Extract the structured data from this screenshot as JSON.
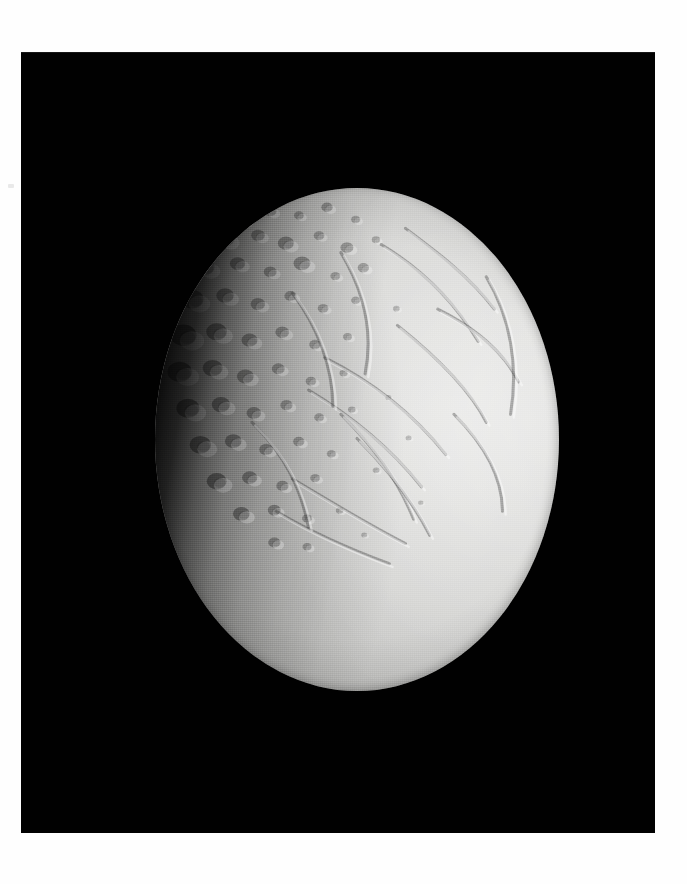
{
  "page": {
    "background_color": "#fefefe",
    "frame_color": "#010101",
    "width": 687,
    "height": 884
  },
  "photo": {
    "subject": "Enceladus",
    "caption": "",
    "frame": {
      "x": 21,
      "y": 52,
      "width": 634,
      "height": 781
    },
    "body": {
      "name": "Enceladus",
      "disk": {
        "center_x": 357,
        "center_y": 440,
        "radius_x": 202,
        "radius_y": 251
      },
      "illumination": "crescent-gibbous, terminator on the left limb",
      "light_direction": "from upper right",
      "surface_color_bright": "#e2e2e0",
      "surface_color_mid": "#c2c2c0",
      "surface_color_shadow": "#2e2e2d",
      "space_color": "#010101"
    },
    "terrain_regions": [
      {
        "name": "cratered-terrain",
        "label": "heavily cratered terrain",
        "position": "west / terminator side"
      },
      {
        "name": "smooth-plains",
        "label": "smooth grooved plains",
        "position": "east / limb side"
      },
      {
        "name": "groove-system",
        "label": "curvilinear grooves and ridges",
        "position": "centre to east"
      }
    ],
    "marks": [
      {
        "name": "margin-speck",
        "x": 8,
        "y": 184
      }
    ]
  },
  "chart_data": {
    "type": "scatter",
    "xlabel": "",
    "ylabel": "",
    "craters": [
      {
        "x": 0.22,
        "y": 0.08,
        "r": 0.02,
        "shade": 0.55
      },
      {
        "x": 0.29,
        "y": 0.06,
        "r": 0.016,
        "shade": 0.5
      },
      {
        "x": 0.36,
        "y": 0.07,
        "r": 0.013,
        "shade": 0.48
      },
      {
        "x": 0.43,
        "y": 0.05,
        "r": 0.015,
        "shade": 0.52
      },
      {
        "x": 0.5,
        "y": 0.08,
        "r": 0.012,
        "shade": 0.45
      },
      {
        "x": 0.18,
        "y": 0.13,
        "r": 0.024,
        "shade": 0.6
      },
      {
        "x": 0.26,
        "y": 0.12,
        "r": 0.018,
        "shade": 0.52
      },
      {
        "x": 0.33,
        "y": 0.14,
        "r": 0.021,
        "shade": 0.55
      },
      {
        "x": 0.41,
        "y": 0.12,
        "r": 0.014,
        "shade": 0.46
      },
      {
        "x": 0.48,
        "y": 0.15,
        "r": 0.017,
        "shade": 0.5
      },
      {
        "x": 0.55,
        "y": 0.13,
        "r": 0.011,
        "shade": 0.42
      },
      {
        "x": 0.13,
        "y": 0.2,
        "r": 0.026,
        "shade": 0.66
      },
      {
        "x": 0.21,
        "y": 0.19,
        "r": 0.02,
        "shade": 0.58
      },
      {
        "x": 0.29,
        "y": 0.21,
        "r": 0.017,
        "shade": 0.52
      },
      {
        "x": 0.37,
        "y": 0.19,
        "r": 0.022,
        "shade": 0.55
      },
      {
        "x": 0.45,
        "y": 0.22,
        "r": 0.013,
        "shade": 0.45
      },
      {
        "x": 0.52,
        "y": 0.2,
        "r": 0.015,
        "shade": 0.47
      },
      {
        "x": 0.1,
        "y": 0.28,
        "r": 0.03,
        "shade": 0.7
      },
      {
        "x": 0.18,
        "y": 0.27,
        "r": 0.023,
        "shade": 0.6
      },
      {
        "x": 0.26,
        "y": 0.29,
        "r": 0.019,
        "shade": 0.54
      },
      {
        "x": 0.34,
        "y": 0.27,
        "r": 0.016,
        "shade": 0.5
      },
      {
        "x": 0.42,
        "y": 0.3,
        "r": 0.014,
        "shade": 0.46
      },
      {
        "x": 0.5,
        "y": 0.28,
        "r": 0.012,
        "shade": 0.43
      },
      {
        "x": 0.08,
        "y": 0.37,
        "r": 0.034,
        "shade": 0.74
      },
      {
        "x": 0.16,
        "y": 0.36,
        "r": 0.027,
        "shade": 0.64
      },
      {
        "x": 0.24,
        "y": 0.38,
        "r": 0.021,
        "shade": 0.56
      },
      {
        "x": 0.32,
        "y": 0.36,
        "r": 0.018,
        "shade": 0.52
      },
      {
        "x": 0.4,
        "y": 0.39,
        "r": 0.015,
        "shade": 0.48
      },
      {
        "x": 0.48,
        "y": 0.37,
        "r": 0.012,
        "shade": 0.44
      },
      {
        "x": 0.07,
        "y": 0.46,
        "r": 0.032,
        "shade": 0.74
      },
      {
        "x": 0.15,
        "y": 0.45,
        "r": 0.026,
        "shade": 0.64
      },
      {
        "x": 0.23,
        "y": 0.47,
        "r": 0.022,
        "shade": 0.57
      },
      {
        "x": 0.31,
        "y": 0.45,
        "r": 0.017,
        "shade": 0.51
      },
      {
        "x": 0.39,
        "y": 0.48,
        "r": 0.014,
        "shade": 0.47
      },
      {
        "x": 0.47,
        "y": 0.46,
        "r": 0.011,
        "shade": 0.43
      },
      {
        "x": 0.09,
        "y": 0.55,
        "r": 0.03,
        "shade": 0.72
      },
      {
        "x": 0.17,
        "y": 0.54,
        "r": 0.024,
        "shade": 0.62
      },
      {
        "x": 0.25,
        "y": 0.56,
        "r": 0.019,
        "shade": 0.55
      },
      {
        "x": 0.33,
        "y": 0.54,
        "r": 0.016,
        "shade": 0.5
      },
      {
        "x": 0.41,
        "y": 0.57,
        "r": 0.013,
        "shade": 0.46
      },
      {
        "x": 0.49,
        "y": 0.55,
        "r": 0.01,
        "shade": 0.42
      },
      {
        "x": 0.12,
        "y": 0.64,
        "r": 0.028,
        "shade": 0.7
      },
      {
        "x": 0.2,
        "y": 0.63,
        "r": 0.022,
        "shade": 0.6
      },
      {
        "x": 0.28,
        "y": 0.65,
        "r": 0.018,
        "shade": 0.54
      },
      {
        "x": 0.36,
        "y": 0.63,
        "r": 0.015,
        "shade": 0.49
      },
      {
        "x": 0.44,
        "y": 0.66,
        "r": 0.012,
        "shade": 0.45
      },
      {
        "x": 0.16,
        "y": 0.73,
        "r": 0.026,
        "shade": 0.68
      },
      {
        "x": 0.24,
        "y": 0.72,
        "r": 0.02,
        "shade": 0.58
      },
      {
        "x": 0.32,
        "y": 0.74,
        "r": 0.016,
        "shade": 0.52
      },
      {
        "x": 0.4,
        "y": 0.72,
        "r": 0.013,
        "shade": 0.47
      },
      {
        "x": 0.22,
        "y": 0.81,
        "r": 0.022,
        "shade": 0.62
      },
      {
        "x": 0.3,
        "y": 0.8,
        "r": 0.017,
        "shade": 0.55
      },
      {
        "x": 0.38,
        "y": 0.82,
        "r": 0.013,
        "shade": 0.48
      },
      {
        "x": 0.46,
        "y": 0.8,
        "r": 0.01,
        "shade": 0.44
      },
      {
        "x": 0.3,
        "y": 0.88,
        "r": 0.016,
        "shade": 0.54
      },
      {
        "x": 0.38,
        "y": 0.89,
        "r": 0.012,
        "shade": 0.48
      },
      {
        "x": 0.6,
        "y": 0.3,
        "r": 0.009,
        "shade": 0.38
      },
      {
        "x": 0.58,
        "y": 0.52,
        "r": 0.008,
        "shade": 0.36
      },
      {
        "x": 0.63,
        "y": 0.62,
        "r": 0.008,
        "shade": 0.36
      },
      {
        "x": 0.55,
        "y": 0.7,
        "r": 0.009,
        "shade": 0.38
      },
      {
        "x": 0.66,
        "y": 0.78,
        "r": 0.007,
        "shade": 0.34
      },
      {
        "x": 0.52,
        "y": 0.86,
        "r": 0.008,
        "shade": 0.38
      }
    ],
    "grooves": [
      {
        "name": "ridge-ne-1",
        "path": "M 0.62 0.10 C 0.70 0.16, 0.78 0.22, 0.84 0.30"
      },
      {
        "name": "ridge-ne-2",
        "path": "M 0.56 0.14 C 0.66 0.20, 0.74 0.28, 0.80 0.38"
      },
      {
        "name": "ridge-e-1",
        "path": "M 0.70 0.30 C 0.78 0.34, 0.86 0.40, 0.90 0.48"
      },
      {
        "name": "ridge-e-2",
        "path": "M 0.60 0.34 C 0.70 0.42, 0.78 0.50, 0.82 0.58"
      },
      {
        "name": "ridge-mid-1",
        "path": "M 0.42 0.42 C 0.54 0.48, 0.64 0.56, 0.72 0.66"
      },
      {
        "name": "ridge-mid-2",
        "path": "M 0.38 0.50 C 0.48 0.56, 0.58 0.64, 0.66 0.74"
      },
      {
        "name": "ridge-mid-3",
        "path": "M 0.46 0.56 C 0.54 0.64, 0.60 0.72, 0.64 0.82"
      },
      {
        "name": "ridge-s-1",
        "path": "M 0.34 0.72 C 0.44 0.78, 0.54 0.84, 0.62 0.88"
      },
      {
        "name": "ridge-s-2",
        "path": "M 0.30 0.80 C 0.40 0.86, 0.50 0.90, 0.58 0.93"
      },
      {
        "name": "ridge-n-1",
        "path": "M 0.46 0.16 C 0.52 0.26, 0.54 0.36, 0.52 0.46"
      },
      {
        "name": "ridge-n-2",
        "path": "M 0.34 0.26 C 0.40 0.34, 0.44 0.44, 0.44 0.54"
      },
      {
        "name": "ridge-w-1",
        "path": "M 0.24 0.58 C 0.32 0.66, 0.36 0.74, 0.38 0.84"
      },
      {
        "name": "ridge-arc-1",
        "path": "M 0.82 0.22 C 0.88 0.32, 0.90 0.44, 0.88 0.56"
      },
      {
        "name": "ridge-arc-2",
        "path": "M 0.74 0.56 C 0.82 0.64, 0.86 0.72, 0.86 0.80"
      },
      {
        "name": "ridge-arc-3",
        "path": "M 0.50 0.62 C 0.58 0.70, 0.64 0.78, 0.68 0.86"
      }
    ]
  }
}
